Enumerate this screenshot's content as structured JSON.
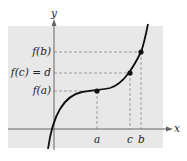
{
  "figure": {
    "type": "function-graph",
    "background_color": "#e8e8e8",
    "axes": {
      "x_label": "x",
      "y_label": "y"
    },
    "y_labels": {
      "fb": "f(b)",
      "fc": "f(c) = d",
      "fa": "f(a)"
    },
    "x_labels": {
      "a": "a",
      "c": "c",
      "b": "b"
    },
    "points": [
      {
        "name": "a",
        "x_label": "a",
        "y_label": "f(a)"
      },
      {
        "name": "c",
        "x_label": "c",
        "y_label": "f(c) = d"
      },
      {
        "name": "b",
        "x_label": "b",
        "y_label": "f(b)"
      }
    ]
  }
}
